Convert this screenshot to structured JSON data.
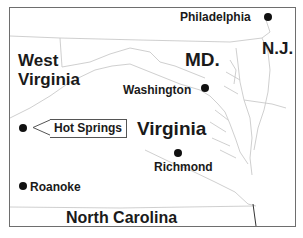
{
  "map": {
    "type": "regional reference map",
    "states": [
      {
        "id": "west-virginia",
        "label_line1": "West",
        "label_line2": "Virginia"
      },
      {
        "id": "maryland",
        "label": "MD."
      },
      {
        "id": "new-jersey",
        "label": "N.J."
      },
      {
        "id": "virginia",
        "label": "Virginia"
      },
      {
        "id": "north-carolina",
        "label": "North Carolina"
      }
    ],
    "cities": [
      {
        "id": "philadelphia",
        "label": "Philadelphia"
      },
      {
        "id": "washington",
        "label": "Washington"
      },
      {
        "id": "richmond",
        "label": "Richmond"
      },
      {
        "id": "roanoke",
        "label": "Roanoke"
      },
      {
        "id": "hot-springs",
        "label": "Hot Springs",
        "highlighted": true
      }
    ],
    "colors": {
      "frame": "#6e6e6e",
      "border_lines": "#c8c8c8",
      "text": "#1a1a1a",
      "city_dot": "#111111"
    }
  }
}
